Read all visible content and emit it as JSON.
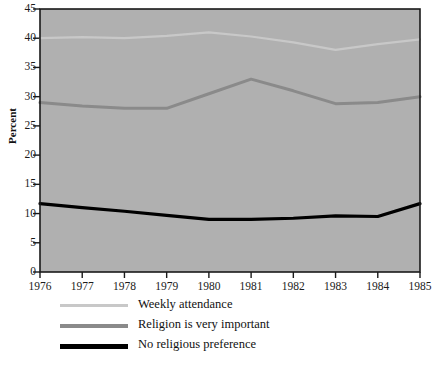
{
  "chart_data": {
    "type": "line",
    "title": "",
    "subtitle": "",
    "xlabel": "",
    "ylabel": "Percent",
    "x": [
      1976,
      1977,
      1978,
      1979,
      1980,
      1981,
      1982,
      1983,
      1984,
      1985
    ],
    "xtick_labels": [
      "1976",
      "1977",
      "1978",
      "1979",
      "1980",
      "1981",
      "1982",
      "1983",
      "1984",
      "1985"
    ],
    "ytick_labels": [
      "0",
      "5",
      "10",
      "15",
      "20",
      "25",
      "30",
      "35",
      "40",
      "45"
    ],
    "yticks": [
      0,
      5,
      10,
      15,
      20,
      25,
      30,
      35,
      40,
      45
    ],
    "xlim": [
      1976,
      1985
    ],
    "ylim": [
      0,
      45
    ],
    "grid": false,
    "legend_position": "below-left",
    "plot_background": "#b0b0b0",
    "figure_background": "#ffffff",
    "axis_color": "#1a1a1a",
    "series": [
      {
        "name": "Weekly attendance",
        "color": "#c8c8c8",
        "width": 2.2,
        "values": [
          40.0,
          40.2,
          40.0,
          40.4,
          41.0,
          40.3,
          39.3,
          38.0,
          39.0,
          39.8
        ]
      },
      {
        "name": "Religion is very important",
        "color": "#8a8a8a",
        "width": 3.0,
        "values": [
          29.0,
          28.4,
          28.0,
          28.0,
          30.5,
          33.0,
          31.0,
          28.8,
          29.0,
          30.0
        ]
      },
      {
        "name": "No religious preference",
        "color": "#000000",
        "width": 3.2,
        "values": [
          11.7,
          11.0,
          10.4,
          9.7,
          9.0,
          9.0,
          9.2,
          9.6,
          9.5,
          11.7
        ]
      }
    ]
  },
  "legend": {
    "items": [
      {
        "label": "Weekly attendance",
        "color": "#c8c8c8",
        "width": 3
      },
      {
        "label": "Religion is very important",
        "color": "#8a8a8a",
        "width": 4
      },
      {
        "label": "No religious preference",
        "color": "#000000",
        "width": 5
      }
    ]
  }
}
